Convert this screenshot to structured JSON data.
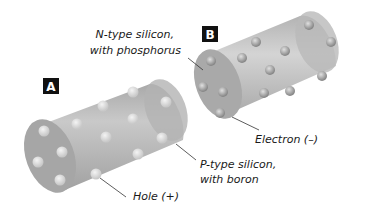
{
  "diagram": {
    "badges": {
      "a": "A",
      "b": "B"
    },
    "labels": {
      "n_type_line1": "N-type silicon,",
      "n_type_line2": "with phosphorus",
      "p_type_line1": "P-type silicon,",
      "p_type_line2": "with boron",
      "electron": "Electron (–)",
      "hole": "Hole (+)"
    },
    "colors": {
      "cylinder": "#bdbdbd",
      "cylinder_dark": "#a3a3a3",
      "particle_hole": "#e2e2e2",
      "particle_electron": "#9a9a9a",
      "badge_bg": "#111111"
    }
  }
}
